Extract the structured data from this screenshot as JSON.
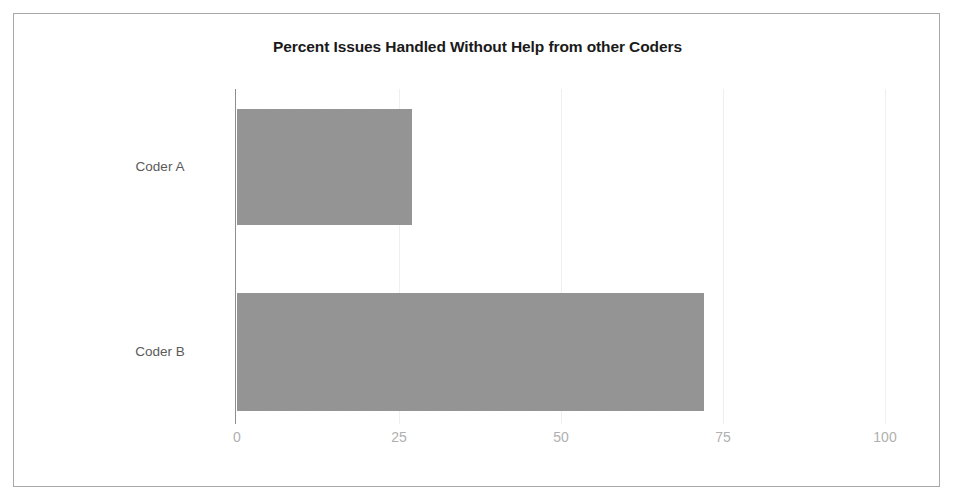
{
  "chart_data": {
    "type": "bar",
    "orientation": "horizontal",
    "title": "Percent Issues Handled Without Help from other Coders",
    "xlabel": "",
    "ylabel": "",
    "categories": [
      "Coder A",
      "Coder B"
    ],
    "values": [
      27,
      72
    ],
    "series": [
      {
        "name": "Percent Issues Handled Without Help",
        "values": [
          27,
          72
        ]
      }
    ],
    "xlim": [
      0,
      100
    ],
    "xticks": [
      0,
      25,
      50,
      75,
      100
    ],
    "xtick_labels": [
      "0",
      "25",
      "50",
      "75",
      "100"
    ],
    "grid": true,
    "grid_axis": "x",
    "legend": false,
    "bar_color": "#969696",
    "axis_color": "#8e8e8e",
    "gridline_color": "#efefef",
    "tick_label_color": "#b0b0b0",
    "category_label_color": "#5a5a5a",
    "title_color": "#1a1a1a",
    "frame_border_color": "#a8a8a8",
    "background_color": "#ffffff"
  }
}
